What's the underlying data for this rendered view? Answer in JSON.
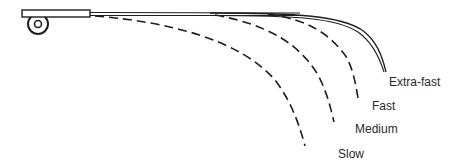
{
  "diagram": {
    "ink_color": "#1e1e1e",
    "labels": {
      "extra_fast": "Extra-fast",
      "fast": "Fast",
      "medium": "Medium",
      "slow": "Slow"
    },
    "curves": [
      {
        "name": "Extra-fast",
        "style": "solid-double"
      },
      {
        "name": "Fast",
        "style": "dashed"
      },
      {
        "name": "Medium",
        "style": "dashed"
      },
      {
        "name": "Slow",
        "style": "dashed"
      }
    ]
  }
}
